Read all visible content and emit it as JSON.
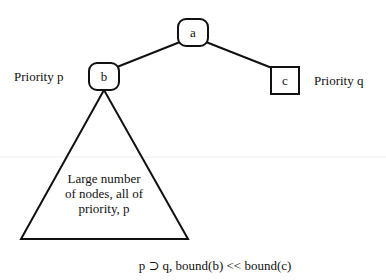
{
  "diagram": {
    "nodes": {
      "a": {
        "label": "a",
        "shape": "rounded-rect"
      },
      "b": {
        "label": "b",
        "shape": "rounded-rect",
        "annotation": "Priority p"
      },
      "c": {
        "label": "c",
        "shape": "square",
        "annotation": "Priority q"
      }
    },
    "edges": [
      {
        "from": "a",
        "to": "b"
      },
      {
        "from": "a",
        "to": "c"
      }
    ],
    "subtree": {
      "root": "b",
      "shape": "triangle",
      "lines": [
        "Large number",
        "of nodes, all of",
        "priority, p"
      ]
    },
    "caption": "p ⊃ q, bound(b) << bound(c)",
    "colors": {
      "stroke": "#111111",
      "background": "#ffffff",
      "divider": "#eeeeee"
    }
  }
}
